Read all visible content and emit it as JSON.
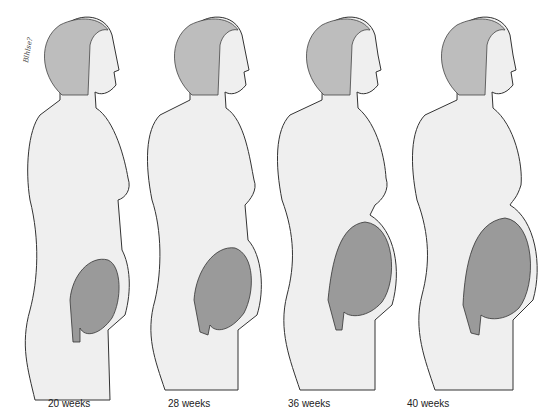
{
  "diagram": {
    "title": "",
    "signature": "Blhlse?",
    "colors": {
      "skin": "#efefef",
      "outline": "#333333",
      "uterus": "#9a9a9a",
      "hair": "#b8b8b8"
    },
    "stages": [
      {
        "label": "20 weeks",
        "uterus_size": "small"
      },
      {
        "label": "28 weeks",
        "uterus_size": "medium"
      },
      {
        "label": "36 weeks",
        "uterus_size": "large"
      },
      {
        "label": "40 weeks",
        "uterus_size": "largest"
      }
    ]
  }
}
